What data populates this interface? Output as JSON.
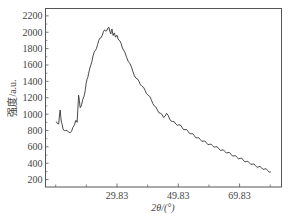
{
  "chart_data": {
    "type": "line",
    "title": "",
    "xlabel": "2θ/(°)",
    "ylabel": "强度/a.u.",
    "xlim": [
      6.5,
      83.5
    ],
    "ylim": [
      110,
      2290
    ],
    "x_ticks": [
      29.83,
      49.83,
      69.83
    ],
    "x_tick_labels": [
      "29.83",
      "49.83",
      "69.83"
    ],
    "x_minor_ticks": [
      9.83,
      19.83,
      39.83,
      59.83,
      79.83
    ],
    "y_ticks": [
      200,
      400,
      600,
      800,
      1000,
      1200,
      1400,
      1600,
      1800,
      2000,
      2200
    ],
    "y_tick_labels": [
      "200",
      "400",
      "600",
      "800",
      "1000",
      "1200",
      "1400",
      "1600",
      "1800",
      "2000",
      "2200"
    ],
    "grid": false,
    "legend": null,
    "series": [
      {
        "name": "XRD",
        "x": [
          10.0,
          10.8,
          11.3,
          11.7,
          12.2,
          13.0,
          14.0,
          15.0,
          15.8,
          16.3,
          16.8,
          17.3,
          17.8,
          18.3,
          19.0,
          19.5,
          20.0,
          20.6,
          21.3,
          22.0,
          22.8,
          23.5,
          24.3,
          25.0,
          25.8,
          26.5,
          27.2,
          27.8,
          28.2,
          28.6,
          29.0,
          29.4,
          29.9,
          30.5,
          31.2,
          32.0,
          33.0,
          34.0,
          35.0,
          36.0,
          37.0,
          38.0,
          39.0,
          40.0,
          41.0,
          42.0,
          43.0,
          44.0,
          45.0,
          46.0,
          47.0,
          48.0,
          49.0,
          50.0,
          51.0,
          52.0,
          53.0,
          54.0,
          55.0,
          56.0,
          57.0,
          58.0,
          59.0,
          60.0,
          61.0,
          62.0,
          63.0,
          64.0,
          65.0,
          66.0,
          67.0,
          68.0,
          69.0,
          70.0,
          71.0,
          72.0,
          73.0,
          74.0,
          75.0,
          76.0,
          77.0,
          78.0,
          79.0,
          80.0
        ],
        "y": [
          910,
          880,
          1050,
          900,
          820,
          800,
          780,
          790,
          860,
          920,
          900,
          1230,
          1080,
          1120,
          1210,
          1300,
          1420,
          1500,
          1600,
          1710,
          1780,
          1850,
          1930,
          1960,
          2030,
          2020,
          2060,
          1980,
          2040,
          1960,
          1990,
          1940,
          1960,
          1900,
          1860,
          1780,
          1690,
          1620,
          1520,
          1440,
          1400,
          1340,
          1290,
          1230,
          1180,
          1100,
          1050,
          1010,
          960,
          1010,
          940,
          910,
          880,
          870,
          840,
          810,
          790,
          760,
          740,
          710,
          690,
          670,
          650,
          630,
          615,
          600,
          580,
          560,
          545,
          530,
          510,
          490,
          470,
          460,
          440,
          420,
          405,
          390,
          370,
          355,
          345,
          330,
          310,
          295
        ]
      }
    ]
  }
}
